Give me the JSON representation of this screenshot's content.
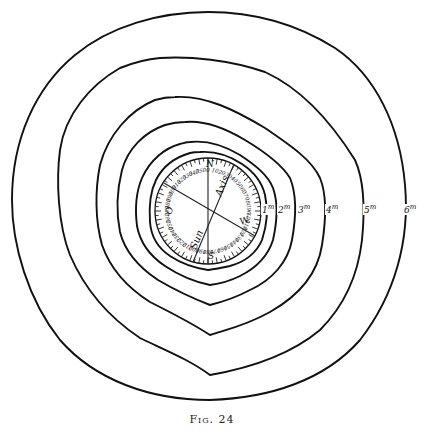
{
  "figure": {
    "caption": "Fig. 24",
    "type": "concentric isoline diagram around a graduated dial",
    "center": [
      208,
      212
    ],
    "contour_labels": [
      {
        "level": "1",
        "unit": "m",
        "x": 262,
        "y": 209
      },
      {
        "level": "2",
        "unit": "m",
        "x": 278,
        "y": 209
      },
      {
        "level": "3",
        "unit": "m",
        "x": 298,
        "y": 209
      },
      {
        "level": "4",
        "unit": "m",
        "x": 326,
        "y": 209
      },
      {
        "level": "5",
        "unit": "m",
        "x": 364,
        "y": 209
      },
      {
        "level": "6",
        "unit": "m",
        "x": 404,
        "y": 209
      }
    ],
    "dial": {
      "radius": 54,
      "direction_labels": {
        "north": "N",
        "south": "S",
        "east": "E",
        "west": "W",
        "other": "O"
      },
      "line_labels": {
        "axis": "Axis",
        "sun": "Sun"
      },
      "graduation_numbers": [
        "0",
        "10",
        "20",
        "30",
        "40",
        "50",
        "60",
        "70",
        "80",
        "90",
        "100",
        "110",
        "120",
        "130",
        "140",
        "150",
        "160",
        "170",
        "180",
        "190",
        "200",
        "210",
        "220",
        "230",
        "240",
        "250",
        "260",
        "270",
        "280",
        "290",
        "300",
        "310",
        "320",
        "330",
        "340",
        "350"
      ]
    }
  },
  "colors": {
    "ink": "#111111",
    "paper": "#ffffff"
  }
}
